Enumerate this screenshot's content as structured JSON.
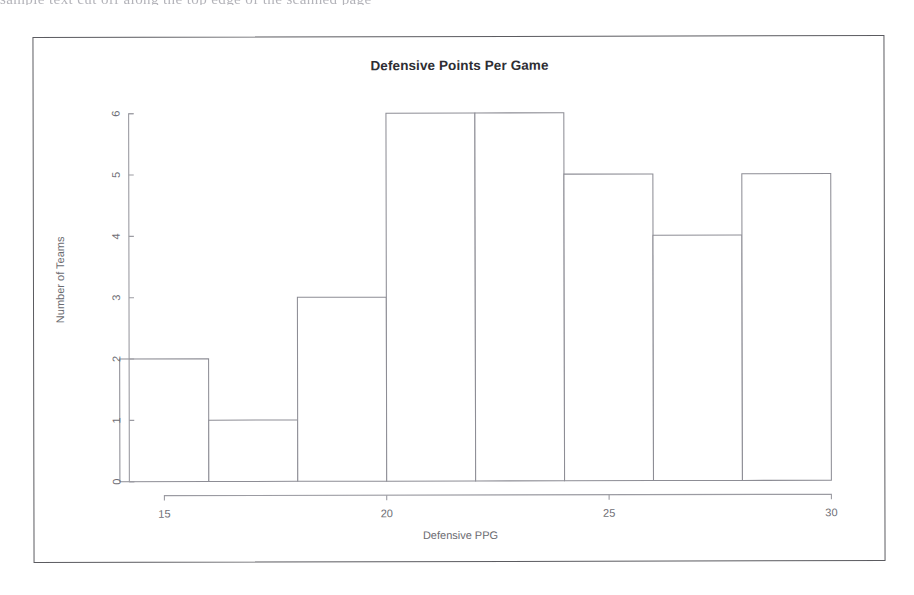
{
  "scan": {
    "top_artifact_text": "sample text cut off along the top edge of the scanned page"
  },
  "chart_data": {
    "type": "bar",
    "title": "Defensive Points Per Game",
    "xlabel": "Defensive PPG",
    "ylabel": "Number of Teams",
    "xlim": [
      13.8,
      30.2
    ],
    "ylim": [
      0,
      6
    ],
    "grid": false,
    "legend": null,
    "bin_width": 2,
    "bin_edges": [
      14,
      16,
      18,
      20,
      22,
      24,
      26,
      28,
      30
    ],
    "categories": [
      "14-16",
      "16-18",
      "18-20",
      "20-22",
      "22-24",
      "24-26",
      "26-28",
      "28-30"
    ],
    "values": [
      2,
      1,
      3,
      6,
      6,
      5,
      4,
      5
    ],
    "xticks": [
      15,
      20,
      25,
      30
    ],
    "xtick_labels": [
      "15",
      "20",
      "25",
      "30"
    ],
    "yticks": [
      0,
      1,
      2,
      3,
      4,
      5,
      6
    ],
    "ytick_labels": [
      "0",
      "1",
      "2",
      "3",
      "4",
      "5",
      "6"
    ],
    "axis_range_x": [
      15,
      30
    ],
    "total_teams": 32
  }
}
